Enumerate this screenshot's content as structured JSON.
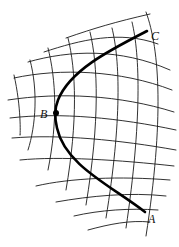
{
  "figure": {
    "colors": {
      "grid": "#1a1a1a",
      "curve": "#000000",
      "background": "#ffffff"
    },
    "points": [
      {
        "id": "A",
        "label": "A",
        "x": 145,
        "y": 212,
        "label_x": 148,
        "label_y": 223
      },
      {
        "id": "B",
        "label": "B",
        "x": 56,
        "y": 113,
        "label_x": 40,
        "label_y": 118
      },
      {
        "id": "C",
        "label": "C",
        "x": 147,
        "y": 31,
        "label_x": 151,
        "label_y": 40
      }
    ],
    "curve_path": "M147,31 C110,50 70,70 58,100 C54,110 55,120 57,128 C65,165 110,185 145,212",
    "grid": {
      "vertical_lines": [
        "M14,75 C22,110 20,140 20,135",
        "M30,60 C38,90 36,125 28,150",
        "M48,48 C56,80 58,120 48,170",
        "M68,38 C76,70 78,120 66,190",
        "M90,32 C98,65 100,120 86,205",
        "M112,28 C120,60 122,120 106,218",
        "M132,22 C140,55 142,120 126,228",
        "M146,12 C160,50 164,120 146,236"
      ],
      "horizontal_lines": [
        "M66,38 C95,28 115,22 150,14",
        "M44,52 C80,40 120,30 158,44",
        "M28,62 C70,50 120,48 170,70",
        "M14,78 C60,68 120,70 172,90",
        "M8,100 C60,92 120,95 174,112",
        "M10,118 C60,112 120,118 176,130",
        "M12,138 C60,134 120,140 176,150",
        "M20,160 C60,156 120,160 174,166",
        "M36,186 C70,178 120,176 170,180",
        "M56,202 C90,196 130,192 166,196",
        "M74,216 C100,210 130,208 158,210",
        "M88,230 C110,224 130,220 150,222"
      ]
    }
  }
}
